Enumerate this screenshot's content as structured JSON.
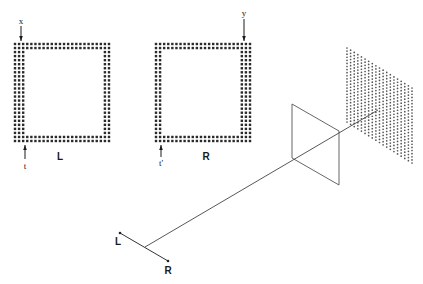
{
  "diagram": {
    "colors": {
      "ink": "#1a1a1a",
      "line": "#444444",
      "dots": "#2a2a2a",
      "plane_dots": "#555555"
    },
    "left_square": {
      "label": "L",
      "label_pos": [
        60,
        157
      ],
      "bounds": {
        "x0": 15,
        "y0": 44,
        "x1": 109,
        "y1": 141
      },
      "spacing": 4.1,
      "bands": {
        "top": 2,
        "bottom": 2,
        "left": 3,
        "right": 2
      },
      "top_marker": {
        "text": "x",
        "x": 21,
        "label_y": 21,
        "arrow_from": 26,
        "arrow_to": 41,
        "direction": "down"
      },
      "bottom_marker": {
        "text": "t",
        "x": 25,
        "label_y": 166,
        "arrow_from": 159,
        "arrow_to": 145,
        "direction": "up"
      }
    },
    "right_square": {
      "label": "R",
      "label_pos": [
        206,
        157
      ],
      "bounds": {
        "x0": 156,
        "y0": 44,
        "x1": 250,
        "y1": 141
      },
      "spacing": 4.1,
      "bands": {
        "top": 2,
        "bottom": 2,
        "left": 2,
        "right": 3
      },
      "top_marker": {
        "text": "y",
        "x": 244,
        "label_y": 13,
        "arrow_from": 19,
        "arrow_to": 41,
        "direction": "down"
      },
      "bottom_marker": {
        "text": "t'",
        "x": 161,
        "label_y": 163,
        "arrow_from": 157,
        "arrow_to": 145,
        "direction": "up"
      }
    },
    "eyes": {
      "left": {
        "label": "L",
        "point": [
          120,
          233
        ],
        "label_pos": [
          118,
          242
        ]
      },
      "right": {
        "label": "R",
        "point": [
          168,
          261
        ],
        "label_pos": [
          168,
          271
        ]
      },
      "junction": [
        145,
        247
      ]
    },
    "sight_line": {
      "from": [
        145,
        247
      ],
      "to": [
        378,
        110
      ]
    },
    "frame": {
      "points": [
        [
          292,
          104
        ],
        [
          339,
          131
        ],
        [
          339,
          185
        ],
        [
          292,
          158
        ]
      ]
    },
    "dot_plane": {
      "corners": {
        "tl": [
          347,
          48
        ],
        "tr": [
          412,
          88
        ],
        "br": [
          412,
          163
        ],
        "bl": [
          347,
          122
        ]
      },
      "cols": 19,
      "rows": 25
    }
  }
}
